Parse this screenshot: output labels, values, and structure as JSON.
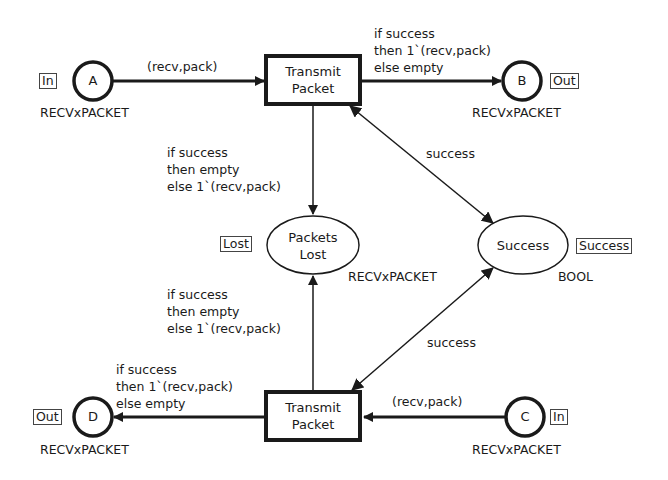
{
  "diagram": {
    "type": "colored-petri-net",
    "places": {
      "A": {
        "name": "A",
        "colorset": "RECVxPACKET",
        "port": "In"
      },
      "B": {
        "name": "B",
        "colorset": "RECVxPACKET",
        "port": "Out"
      },
      "C": {
        "name": "C",
        "colorset": "RECVxPACKET",
        "port": "In"
      },
      "D": {
        "name": "D",
        "colorset": "RECVxPACKET",
        "port": "Out"
      },
      "packets_lost": {
        "name_line1": "Packets",
        "name_line2": "Lost",
        "colorset": "RECVxPACKET",
        "fusion": "Lost"
      },
      "success": {
        "name": "Success",
        "colorset": "BOOL",
        "fusion": "Success"
      }
    },
    "transitions": {
      "top": {
        "line1": "Transmit",
        "line2": "Packet"
      },
      "bottom": {
        "line1": "Transmit",
        "line2": "Packet"
      }
    },
    "arcs": {
      "a_to_top": "(recv,pack)",
      "top_to_b": "if success\nthen 1`(recv,pack)\nelse empty",
      "top_to_lost": "if success\nthen empty\nelse 1`(recv,pack)",
      "top_success": "success",
      "bottom_to_lost": "if success\nthen empty\nelse 1`(recv,pack)",
      "bottom_success": "success",
      "c_to_bottom": "(recv,pack)",
      "bottom_to_d": "if success\nthen 1`(recv,pack)\nelse empty"
    }
  }
}
